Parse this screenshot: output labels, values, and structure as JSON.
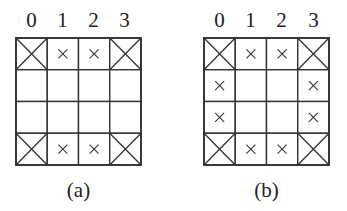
{
  "diagrams": [
    {
      "id": "a",
      "caption": "(a)",
      "column_labels": [
        "0",
        "1",
        "2",
        "3"
      ],
      "rows": 4,
      "cols": 4,
      "cells": [
        [
          "big-x",
          "small-x",
          "small-x",
          "big-x"
        ],
        [
          "empty",
          "empty",
          "empty",
          "empty"
        ],
        [
          "empty",
          "empty",
          "empty",
          "empty"
        ],
        [
          "big-x",
          "small-x",
          "small-x",
          "big-x"
        ]
      ]
    },
    {
      "id": "b",
      "caption": "(b)",
      "column_labels": [
        "0",
        "1",
        "2",
        "3"
      ],
      "rows": 4,
      "cols": 4,
      "cells": [
        [
          "big-x",
          "small-x",
          "small-x",
          "big-x"
        ],
        [
          "small-x",
          "empty",
          "empty",
          "small-x"
        ],
        [
          "small-x",
          "empty",
          "empty",
          "small-x"
        ],
        [
          "big-x",
          "small-x",
          "small-x",
          "big-x"
        ]
      ]
    }
  ],
  "colors": {
    "line": "#333333",
    "background": "#ffffff"
  }
}
